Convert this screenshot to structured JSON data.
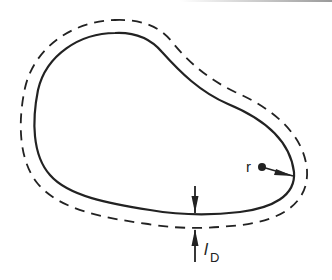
{
  "figure": {
    "type": "diffusion boundary sketch",
    "labels": {
      "point": "r",
      "length_main": "l",
      "length_subscript": "D"
    },
    "curves": [
      {
        "name": "body-surface",
        "style": "solid"
      },
      {
        "name": "diffusion-layer-boundary",
        "style": "dashed"
      }
    ],
    "colors": {
      "line": "#222222",
      "background": "#ffffff"
    }
  }
}
